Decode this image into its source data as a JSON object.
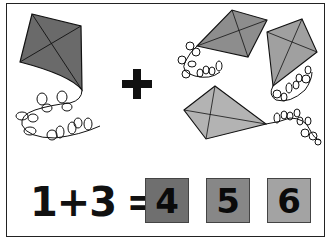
{
  "problem": {
    "left_operand": "1",
    "operator": "+",
    "right_operand": "3",
    "equals": "=",
    "group_operator": "+"
  },
  "answers": [
    {
      "label": "4",
      "color": "#6f6f6f"
    },
    {
      "label": "5",
      "color": "#878787"
    },
    {
      "label": "6",
      "color": "#a3a3a3"
    }
  ],
  "groups": {
    "left": {
      "kite_count": 1,
      "kite_color": "#6a6a6a"
    },
    "right": {
      "kite_count": 3,
      "kite_colors": [
        "#8d8d8d",
        "#a0a0a0",
        "#b3b3b3"
      ]
    }
  }
}
